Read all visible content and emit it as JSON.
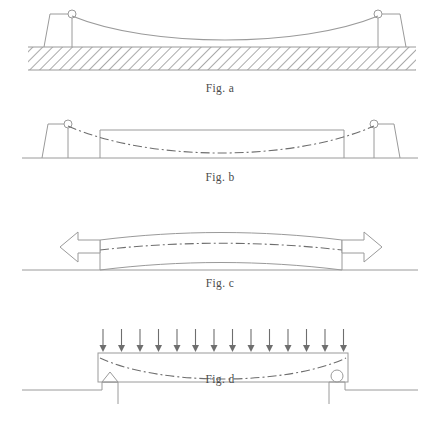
{
  "sheet": {
    "width": 440,
    "height": 425,
    "background": "#ffffff",
    "line_color": "#9a9a9a",
    "dark_line_color": "#6e6e6e",
    "hatch_color": "#8d8d8d",
    "caption_color": "#4a4a4a",
    "arrow_color": "#7a7a7a"
  },
  "figures": [
    {
      "id": "fig-a",
      "caption": "Fig. a",
      "description": "suspension cable sagging between two towers on hatched ground",
      "ground": {
        "y": 47,
        "x_start": 28,
        "x_end": 416,
        "hatch_height": 23,
        "hatch_angle_deg": 45
      },
      "towers": [
        {
          "side": "left",
          "x": 72,
          "top_y": 14,
          "base_y": 47,
          "pin_radius": 4
        },
        {
          "side": "right",
          "x": 378,
          "top_y": 14,
          "base_y": 47,
          "pin_radius": 4
        }
      ],
      "cable": {
        "left_x": 72,
        "right_x": 378,
        "top_y": 16,
        "sag_y": 41
      }
    },
    {
      "id": "fig-b",
      "caption": "Fig. b",
      "description": "beam outline between towers with dash-dot deflected centerline",
      "ground": {
        "y": 158,
        "x_start": 22,
        "x_end": 418
      },
      "towers": [
        {
          "side": "left",
          "x": 68,
          "top_y": 124,
          "base_y": 158,
          "pin_radius": 4
        },
        {
          "side": "right",
          "x": 374,
          "top_y": 124,
          "base_y": 158,
          "pin_radius": 4
        }
      ],
      "beam": {
        "left_x": 100,
        "right_x": 344,
        "top_y": 130,
        "bottom_y": 158
      },
      "centerline": {
        "left_x": 68,
        "right_x": 374,
        "start_y": 126,
        "sag_y": 151,
        "style": "dash-dot"
      }
    },
    {
      "id": "fig-c",
      "caption": "Fig. c",
      "description": "curved beam in tension with hollow double arrows at both ends",
      "ground": {
        "y": 270,
        "x_start": 22,
        "x_end": 418
      },
      "beam": {
        "left_x": 100,
        "right_x": 342,
        "top_y": 236,
        "bottom_y": 268,
        "camber": 8
      },
      "centerline": {
        "left_x": 100,
        "right_x": 342,
        "y": 248,
        "style": "dash-dot"
      },
      "arrows": [
        {
          "side": "left",
          "direction": "left",
          "tip_x": 62,
          "tail_x": 100,
          "y": 246,
          "style": "hollow-outline"
        },
        {
          "side": "right",
          "direction": "right",
          "tip_x": 382,
          "tail_x": 342,
          "y": 246,
          "style": "hollow-outline"
        }
      ]
    },
    {
      "id": "fig-d",
      "caption": "Fig. d",
      "description": "simply supported beam with uniformly distributed load, pin support left and roller support right",
      "beam": {
        "left_x": 98,
        "right_x": 348,
        "top_y": 353,
        "bottom_y": 382
      },
      "centerline": {
        "left_x": 100,
        "right_x": 346,
        "start_y": 358,
        "sag_y": 374,
        "style": "dash-dot"
      },
      "load": {
        "count": 14,
        "first_x": 103,
        "last_x": 344,
        "top_y": 329,
        "tip_y": 352,
        "label": "uniformly-distributed-load"
      },
      "supports": [
        {
          "side": "left",
          "type": "pin",
          "x": 110,
          "y": 382,
          "size": 10
        },
        {
          "side": "right",
          "type": "roller",
          "x": 337,
          "y": 382,
          "radius": 6
        }
      ],
      "ground": {
        "y": 390,
        "left_x_start": 22,
        "left_x_end": 118,
        "right_x_start": 330,
        "right_x_end": 418,
        "step_depth": 14
      }
    }
  ]
}
